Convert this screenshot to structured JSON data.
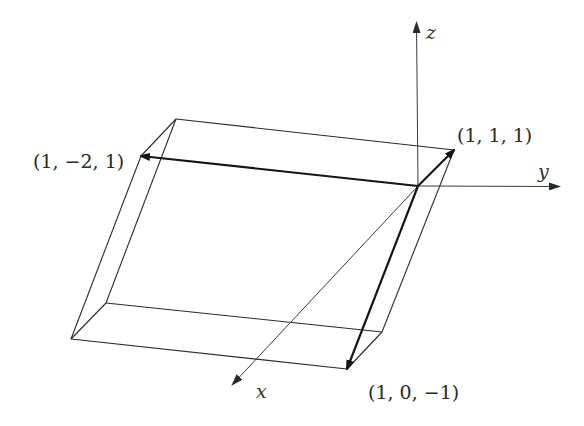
{
  "diagram": {
    "type": "3d-parallelepiped-vectors",
    "colors": {
      "background": "#ffffff",
      "edge": "#2b2b2b",
      "vector": "#151515",
      "axis": "#3a3a3a"
    },
    "axes": {
      "x": {
        "label": "x"
      },
      "y": {
        "label": "y"
      },
      "z": {
        "label": "z"
      }
    },
    "vectors": [
      {
        "id": "v1",
        "label": "(1, 1, 1)"
      },
      {
        "id": "v2",
        "label": "(1, −2, 1)"
      },
      {
        "id": "v3",
        "label": "(1, 0, −1)"
      }
    ]
  }
}
